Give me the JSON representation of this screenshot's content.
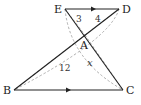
{
  "diagram": {
    "type": "geometry",
    "points": {
      "E": {
        "label": "E",
        "x": 65,
        "y": 9
      },
      "D": {
        "label": "D",
        "x": 119,
        "y": 9
      },
      "A": {
        "label": "A",
        "x": 85,
        "y": 35
      },
      "B": {
        "label": "B",
        "x": 14,
        "y": 90
      },
      "C": {
        "label": "C",
        "x": 123,
        "y": 90
      }
    },
    "segment_labels": {
      "EA": "3",
      "DA": "4",
      "BA": "12",
      "AC": "x"
    },
    "parallel_marks": [
      "ED",
      "BC"
    ],
    "colors": {
      "solid": "#222222",
      "dashed": "#999999"
    }
  }
}
